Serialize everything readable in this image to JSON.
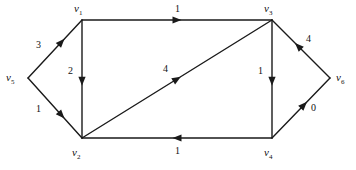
{
  "figure": {
    "type": "directed-graph",
    "width": 356,
    "height": 170,
    "background": "#ffffff",
    "stroke_color": "#1a1a1a",
    "text_color": "#111111"
  },
  "graph_data": {
    "type": "diagram",
    "kind": "flow-network",
    "directed": true,
    "nodes": [
      {
        "id": "v5",
        "label": "v",
        "sub": "5",
        "x": 28,
        "y": 78,
        "label_x": 6,
        "label_y": 72
      },
      {
        "id": "v1",
        "label": "v",
        "sub": "1",
        "x": 82,
        "y": 20,
        "label_x": 74,
        "label_y": 3
      },
      {
        "id": "v2",
        "label": "v",
        "sub": "2",
        "x": 82,
        "y": 138,
        "label_x": 72,
        "label_y": 147
      },
      {
        "id": "v3",
        "label": "v",
        "sub": "3",
        "x": 272,
        "y": 20,
        "label_x": 264,
        "label_y": 3
      },
      {
        "id": "v4",
        "label": "v",
        "sub": "4",
        "x": 272,
        "y": 138,
        "label_x": 264,
        "label_y": 147
      },
      {
        "id": "v6",
        "label": "v",
        "sub": "6",
        "x": 330,
        "y": 78,
        "label_x": 336,
        "label_y": 72
      }
    ],
    "edges": [
      {
        "id": "e-v5-v1",
        "from": "v5",
        "to": "v1",
        "label": "3",
        "label_x": 36,
        "label_y": 40,
        "arrow_t": 0.62
      },
      {
        "id": "e-v5-v2",
        "from": "v5",
        "to": "v2",
        "label": "1",
        "label_x": 36,
        "label_y": 104,
        "arrow_t": 0.62
      },
      {
        "id": "e-v1-v3",
        "from": "v1",
        "to": "v3",
        "label": "1",
        "label_x": 175,
        "label_y": 4,
        "arrow_t": 0.5
      },
      {
        "id": "e-v1-v2",
        "from": "v1",
        "to": "v2",
        "label": "2",
        "label_x": 68,
        "label_y": 66,
        "arrow_t": 0.52
      },
      {
        "id": "e-v2-v3",
        "from": "v2",
        "to": "v3",
        "label": "4",
        "label_x": 163,
        "label_y": 64,
        "arrow_t": 0.5
      },
      {
        "id": "e-v3-v4",
        "from": "v3",
        "to": "v4",
        "label": "1",
        "label_x": 258,
        "label_y": 66,
        "arrow_t": 0.52
      },
      {
        "id": "e-v4-v2",
        "from": "v4",
        "to": "v2",
        "label": "1",
        "label_x": 175,
        "label_y": 146,
        "arrow_t": 0.5
      },
      {
        "id": "e-v4-v6",
        "from": "v4",
        "to": "v6",
        "label": "0",
        "label_x": 311,
        "label_y": 103,
        "arrow_t": 0.55
      },
      {
        "id": "e-v6-v3",
        "from": "v6",
        "to": "v3",
        "label": "4",
        "label_x": 306,
        "label_y": 34,
        "arrow_t": 0.55
      }
    ]
  }
}
